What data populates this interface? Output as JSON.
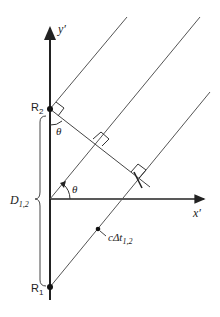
{
  "labels": {
    "y_axis": "y′",
    "x_axis": "x′",
    "r2": "R",
    "r2_sub": "2",
    "r1": "R",
    "r1_sub": "1",
    "theta_top": "θ",
    "theta_origin": "θ",
    "distance": "D",
    "distance_sub": "1,2",
    "path": "cΔt",
    "path_sub": "1,2"
  },
  "colors": {
    "stroke": "#222222",
    "line": "#555555",
    "background": "#ffffff"
  }
}
